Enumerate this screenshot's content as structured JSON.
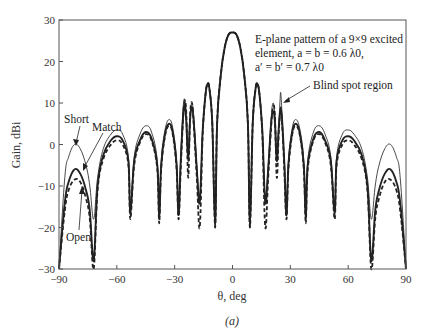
{
  "chart_data": {
    "type": "line",
    "title": "E-plane pattern of a 9×9 excited element, a = b = 0.6 λ0, a′ = b′ = 0.7 λ0",
    "annotation_lines": [
      "E-plane pattern of a 9×9 excited",
      "element, a = b = 0.6 λ0,",
      "a′ = b′ = 0.7 λ0"
    ],
    "xlabel": "θ, deg",
    "ylabel": "Gain, dBi",
    "caption": "(a)",
    "xlim": [
      -90,
      90
    ],
    "ylim": [
      -30,
      30
    ],
    "xticks": [
      -90,
      -60,
      -30,
      0,
      30,
      60,
      90
    ],
    "yticks": [
      -30,
      -20,
      -10,
      0,
      10,
      20,
      30
    ],
    "grid": false,
    "legend": "inline labels with arrows",
    "series_labels": {
      "short": "Short",
      "match": "Match",
      "open": "Open"
    },
    "callout": "Blind spot region",
    "series": [
      {
        "name": "Short",
        "style": "thin solid",
        "x": [
          -90,
          -87,
          -85,
          -82,
          -79,
          -76,
          -74,
          -72,
          -70,
          -67,
          -63,
          -60,
          -57,
          -54,
          -53,
          -51,
          -48,
          -45,
          -42,
          -39,
          -38,
          -37,
          -35,
          -33,
          -31,
          -29,
          -28,
          -27,
          -26,
          -25,
          -24,
          -23,
          -22,
          -21,
          -20,
          -18.5,
          -17,
          -15.5,
          -14,
          -13,
          -12,
          -10.5,
          -9,
          -8,
          -6,
          -4,
          -2,
          0,
          2,
          4,
          6,
          8,
          9,
          10.5,
          12,
          13,
          14,
          15.5,
          17,
          18.5,
          20,
          21,
          22,
          23,
          24,
          24.6,
          25,
          25.6,
          26,
          27,
          28,
          29,
          31,
          33,
          35,
          37,
          38,
          39,
          42,
          45,
          48,
          51,
          53,
          54,
          57,
          60,
          63,
          67,
          70,
          72,
          74,
          76,
          79,
          82,
          85,
          87,
          90
        ],
        "y": [
          -30,
          -8,
          -3,
          0,
          -1,
          -5,
          -10,
          -18,
          -8,
          -1,
          2.5,
          3.5,
          2.5,
          -3,
          -16,
          -3,
          2.5,
          4.5,
          3,
          -4,
          -18,
          -4,
          3.5,
          6,
          4,
          -4,
          -17,
          -5,
          6,
          11,
          7,
          -2,
          7,
          10,
          6,
          -5,
          -13,
          3,
          12,
          14.5,
          13.5,
          5,
          -20,
          5,
          17,
          23.5,
          26.5,
          27,
          26.5,
          23.5,
          17,
          5,
          -20,
          5,
          13.5,
          14.5,
          12,
          3,
          -13,
          -5,
          6,
          10,
          7,
          -2,
          5,
          10,
          12.5,
          8,
          2,
          -5,
          -17,
          -4,
          4,
          6,
          3.5,
          -4,
          -18,
          -4,
          3,
          4.5,
          2.5,
          -3,
          -16,
          -3,
          2.5,
          3.5,
          2.5,
          -1,
          -8,
          -18,
          -10,
          -5,
          -1,
          0,
          -3,
          -8,
          -30
        ]
      },
      {
        "name": "Match",
        "style": "thick solid",
        "x": [
          -90,
          -87,
          -85,
          -82,
          -79,
          -76,
          -74,
          -72,
          -70,
          -67,
          -63,
          -60,
          -57,
          -54,
          -53,
          -51,
          -48,
          -45,
          -42,
          -39,
          -38,
          -37,
          -35,
          -33,
          -31,
          -29,
          -28,
          -27,
          -26,
          -25,
          -24,
          -23,
          -22,
          -21,
          -20,
          -18.5,
          -17,
          -15.5,
          -14,
          -13,
          -12,
          -10.5,
          -9,
          -8,
          -6,
          -4,
          -2,
          0,
          2,
          4,
          6,
          8,
          9,
          10.5,
          12,
          13,
          14,
          15.5,
          17,
          18.5,
          20,
          21,
          22,
          23,
          24,
          25,
          26,
          27,
          28,
          29,
          31,
          33,
          35,
          37,
          38,
          39,
          42,
          45,
          48,
          51,
          53,
          54,
          57,
          60,
          63,
          67,
          70,
          72,
          74,
          76,
          79,
          82,
          85,
          87,
          90
        ],
        "y": [
          -30,
          -14,
          -9,
          -6,
          -7,
          -11,
          -16,
          -28,
          -10,
          -2.5,
          1,
          2,
          1,
          -4,
          -17,
          -4,
          1,
          3,
          1.5,
          -5,
          -18,
          -5,
          2.5,
          5,
          3,
          -5,
          -17,
          -6,
          4,
          9.5,
          6,
          -4,
          6,
          9,
          5,
          -6,
          -14,
          3,
          12,
          14.5,
          13.5,
          5,
          -20,
          5,
          17,
          23.5,
          26.5,
          27,
          26.5,
          23.5,
          17,
          5,
          -20,
          5,
          13.5,
          14.5,
          12,
          3,
          -14,
          -6,
          5,
          8,
          5.5,
          -4,
          4,
          9,
          4,
          -6,
          -17,
          -5,
          3,
          5,
          2.5,
          -5,
          -18,
          -5,
          1.5,
          3,
          1,
          -4,
          -17,
          -4,
          1,
          2,
          1,
          -2.5,
          -10,
          -28,
          -16,
          -11,
          -7,
          -6,
          -9,
          -14,
          -30
        ]
      },
      {
        "name": "Open",
        "style": "dashed",
        "x": [
          -90,
          -87,
          -85,
          -82,
          -79,
          -76,
          -74,
          -72,
          -70,
          -67,
          -63,
          -60,
          -57,
          -54,
          -53,
          -51,
          -48,
          -45,
          -42,
          -39,
          -38,
          -37,
          -35,
          -33,
          -31,
          -29,
          -28,
          -27,
          -26,
          -25,
          -24,
          -23,
          -22,
          -21,
          -20,
          -18.5,
          -17,
          -15.5,
          -14,
          -13,
          -12,
          -10.5,
          -9,
          -8,
          -6,
          -4,
          -2,
          0,
          2,
          4,
          6,
          8,
          9,
          10.5,
          12,
          13,
          14,
          15.5,
          17,
          18.5,
          20,
          21,
          22,
          23,
          24,
          25,
          26,
          27,
          28,
          29,
          31,
          33,
          35,
          37,
          38,
          39,
          42,
          45,
          48,
          51,
          53,
          54,
          57,
          60,
          63,
          67,
          70,
          72,
          74,
          76,
          79,
          82,
          85,
          87,
          90
        ],
        "y": [
          -30,
          -16,
          -11,
          -8.5,
          -9,
          -13,
          -18,
          -30,
          -11,
          -3.5,
          0,
          1,
          0,
          -5,
          -18,
          -5,
          0.5,
          2.5,
          1,
          -6,
          -19,
          -6,
          2,
          4.5,
          2.5,
          -6,
          -18,
          -8,
          3,
          10,
          8,
          -8,
          7,
          10,
          4,
          -8,
          -20,
          2,
          12,
          14.5,
          13.5,
          5,
          -20,
          5,
          17,
          23.5,
          26.5,
          27,
          26.5,
          23.5,
          17,
          5,
          -20,
          5,
          13.5,
          14.5,
          12,
          2,
          -20,
          -8,
          4,
          9,
          7,
          -8,
          3,
          8,
          3,
          -8,
          -18,
          -6,
          2.5,
          4.5,
          2,
          -6,
          -19,
          -6,
          1,
          2.5,
          0.5,
          -5,
          -18,
          -5,
          0,
          1,
          0,
          -3.5,
          -11,
          -30,
          -18,
          -13,
          -9,
          -8.5,
          -11,
          -16,
          -30
        ]
      }
    ]
  }
}
